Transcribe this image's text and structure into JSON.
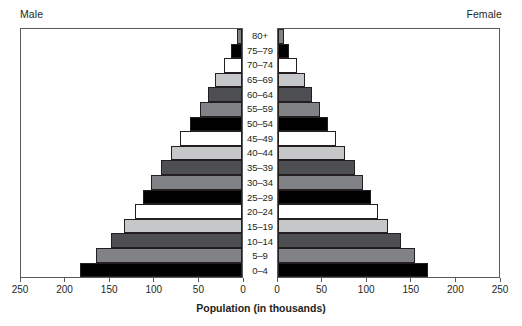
{
  "labels": {
    "male": "Male",
    "female": "Female",
    "x_axis_title": "Population (in thousands)"
  },
  "axis": {
    "ticks": [
      0,
      50,
      100,
      150,
      200,
      250
    ],
    "tick_labels": [
      "0",
      "50",
      "100",
      "150",
      "200",
      "250"
    ],
    "max": 250
  },
  "palette": {
    "black": "#000000",
    "white": "#ffffff",
    "light_gray": "#c6c7c9",
    "dark_gray": "#4d4f53",
    "mid_gray": "#808285",
    "outline": "#231f20",
    "panel_border": "#58595b",
    "background": "#ffffff"
  },
  "chart_data": {
    "type": "bar",
    "subtype": "population-pyramid",
    "title": "",
    "xlabel": "Population (in thousands)",
    "ylabel": "",
    "xlim": [
      0,
      250
    ],
    "grid": false,
    "legend": "none",
    "categories": [
      "80+",
      "75–79",
      "70–74",
      "65–69",
      "60–64",
      "55–59",
      "50–54",
      "45–49",
      "40–44",
      "35–39",
      "30–34",
      "25–29",
      "20–24",
      "15–19",
      "10–14",
      "5–9",
      "0–4"
    ],
    "series": [
      {
        "name": "Male",
        "direction": "left",
        "values": [
          6,
          12,
          20,
          30,
          39,
          48,
          59,
          70,
          80,
          92,
          103,
          112,
          121,
          133,
          148,
          165,
          183
        ]
      },
      {
        "name": "Female",
        "direction": "right",
        "values": [
          7,
          13,
          21,
          30,
          38,
          47,
          56,
          66,
          76,
          87,
          96,
          105,
          113,
          124,
          139,
          155,
          170
        ]
      }
    ],
    "bar_colors": [
      "#808285",
      "#000000",
      "#ffffff",
      "#c6c7c9",
      "#4d4f53",
      "#808285",
      "#000000",
      "#ffffff",
      "#c6c7c9",
      "#4d4f53",
      "#808285",
      "#000000",
      "#ffffff",
      "#c6c7c9",
      "#4d4f53",
      "#808285",
      "#000000"
    ]
  }
}
